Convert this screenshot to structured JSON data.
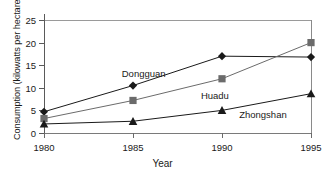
{
  "chart_data": {
    "type": "line",
    "title": "",
    "xlabel": "Year",
    "ylabel": "Consumption (kilowatts per hectare)",
    "x": [
      1980,
      1985,
      1990,
      1995
    ],
    "xticklabels": [
      "1980",
      "1985",
      "1990",
      "1995"
    ],
    "yticks": [
      0,
      5,
      10,
      15,
      20,
      25
    ],
    "yticklabels": [
      "0",
      "5",
      "10",
      "15",
      "20",
      "25"
    ],
    "ylim": [
      0,
      25
    ],
    "xlim": [
      1980,
      1995
    ],
    "grid": false,
    "legend_position": "inline-annotations",
    "series": [
      {
        "name": "Dongguan",
        "marker": "diamond",
        "color": "#1a1a1a",
        "values": [
          4.7,
          10.5,
          17.0,
          16.8
        ],
        "label_x": 1985.6,
        "label_y": 13.2
      },
      {
        "name": "Huadu",
        "marker": "square",
        "color": "#6b6b6b",
        "values": [
          3.2,
          7.2,
          12.0,
          20.0
        ],
        "label_x": 1989.6,
        "label_y": 8.4
      },
      {
        "name": "Zhongshan",
        "marker": "triangle",
        "color": "#1a1a1a",
        "values": [
          2.0,
          2.6,
          5.0,
          8.7
        ],
        "label_x": 1992.3,
        "label_y": 4.2
      }
    ]
  },
  "axis": {
    "y_title": "Consumption (kilowatts per hectare)",
    "x_title": "Year"
  }
}
